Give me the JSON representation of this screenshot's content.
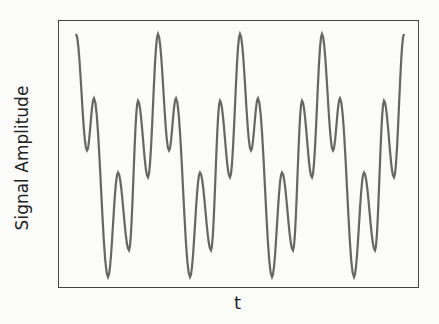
{
  "chart_data": {
    "type": "line",
    "title": "",
    "xlabel": "t",
    "ylabel": "Signal Amplitude",
    "grid": false,
    "legend": null,
    "xticks": [],
    "yticks": [],
    "periods": 4,
    "series": [
      {
        "name": "signal",
        "color": "#666666",
        "period_keypoints_normalized": [
          {
            "phase": 0.0,
            "value": 1.0
          },
          {
            "phase": 0.134,
            "value": 0.04
          },
          {
            "phase": 0.22,
            "value": 0.47
          },
          {
            "phase": 0.39,
            "value": -1.0
          },
          {
            "phase": 0.512,
            "value": -0.14
          },
          {
            "phase": 0.646,
            "value": -0.78
          },
          {
            "phase": 0.756,
            "value": 0.45
          },
          {
            "phase": 0.878,
            "value": -0.18
          },
          {
            "phase": 1.0,
            "value": 1.0
          }
        ]
      }
    ]
  },
  "axes": {
    "xlabel": "t",
    "ylabel": "Signal Amplitude"
  }
}
